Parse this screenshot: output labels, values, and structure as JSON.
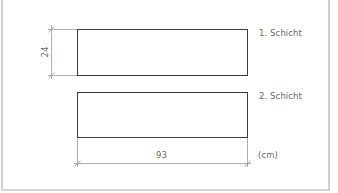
{
  "diagram": {
    "layers": [
      {
        "label": "1. Schicht"
      },
      {
        "label": "2. Schicht"
      }
    ],
    "dimensions": {
      "height": "24",
      "width": "93",
      "unit": "(cm)"
    },
    "colors": {
      "outline": "#3a3a3a",
      "dimension_line": "#9a9a9a",
      "frame": "#cfcfcf"
    }
  }
}
